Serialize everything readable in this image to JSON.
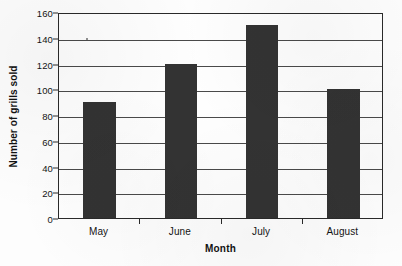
{
  "chart_data": {
    "type": "bar",
    "title": "",
    "subtitle": "",
    "categories": [
      "May",
      "June",
      "July",
      "August"
    ],
    "values": [
      90,
      120,
      150,
      100
    ],
    "xlabel": "Month",
    "ylabel": "Number of grills sold",
    "ylim": [
      0,
      160
    ],
    "ytick_values": [
      0,
      20,
      40,
      60,
      80,
      100,
      120,
      140,
      160
    ],
    "ytick_labels": [
      "0",
      "20",
      "40",
      "60",
      "80",
      "100",
      "120",
      "140",
      "160"
    ],
    "ytick_interval": 20,
    "grid": true,
    "grid_axis": "y",
    "legend": false,
    "legend_position": "none",
    "bar_color": "#333333",
    "plot_background": "#fefefe",
    "axis_color": "#2a2a2a",
    "gridline_color": "#4a4a4a",
    "series": [
      {
        "name": "Number of grills sold",
        "values": [
          90,
          120,
          150,
          100
        ]
      }
    ]
  }
}
